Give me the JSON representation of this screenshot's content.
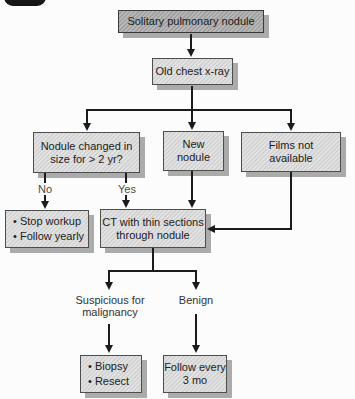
{
  "diagram": {
    "type": "flowchart",
    "nodes": {
      "solitary": {
        "lines": [
          "Solitary pulmonary nodule"
        ]
      },
      "old_xray": {
        "lines": [
          "Old chest x-ray"
        ]
      },
      "nodule_changed": {
        "lines": [
          "Nodule changed in",
          "size for > 2 yr?"
        ]
      },
      "new_nodule": {
        "lines": [
          "New",
          "nodule"
        ]
      },
      "films": {
        "lines": [
          "Films not",
          "available"
        ]
      },
      "stop_workup": {
        "lines": [
          "• Stop workup",
          "• Follow yearly"
        ]
      },
      "ct": {
        "lines": [
          "CT with thin sections",
          "through nodule"
        ]
      },
      "biopsy": {
        "lines": [
          "• Biopsy",
          "• Resect"
        ]
      },
      "follow": {
        "lines": [
          "Follow every",
          "3 mo"
        ]
      }
    },
    "edge_labels": {
      "no": "No",
      "yes": "Yes",
      "suspicious_line1": "Suspicious for",
      "suspicious_line2": "malignancy",
      "benign": "Benign"
    },
    "colors": {
      "box_dark": "#a7a7a7",
      "box_light": "#d8d8d8",
      "box_border": "#4d4d4d",
      "shadow": "#ababab",
      "line": "#1b1b1b",
      "background": "#fcfcfc"
    }
  }
}
